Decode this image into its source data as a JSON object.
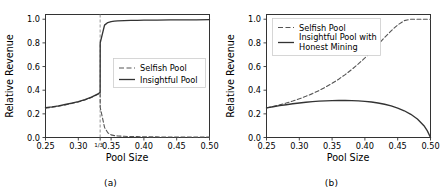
{
  "figure": {
    "panels": [
      {
        "caption": "(a)",
        "axis": {
          "xlabel": "Pool Size",
          "ylabel": "Relative Revenue",
          "xticks": [
            "0.25",
            "0.30",
            "0.35",
            "0.40",
            "0.45",
            "0.50"
          ],
          "xtick_values": [
            0.25,
            0.3,
            0.35,
            0.4,
            0.45,
            0.5
          ],
          "xtick_extra": {
            "label": "1/3",
            "value": 0.3333
          },
          "yticks": [
            "0.0",
            "0.2",
            "0.4",
            "0.6",
            "0.8",
            "1.0"
          ],
          "ytick_values": [
            0.0,
            0.2,
            0.4,
            0.6,
            0.8,
            1.0
          ],
          "xlim": [
            0.25,
            0.5
          ],
          "ylim": [
            0.0,
            1.04
          ]
        },
        "legend": {
          "position": "center-right",
          "entries": [
            {
              "label": "Selfish Pool",
              "style": "dashed",
              "color": "#555555"
            },
            {
              "label": "Insightful Pool",
              "style": "solid",
              "color": "#333333"
            }
          ]
        },
        "vline": {
          "value": 0.3333,
          "style": "dashed",
          "color": "#888888"
        }
      },
      {
        "caption": "(b)",
        "axis": {
          "xlabel": "Pool Size",
          "ylabel": "Relative Revenue",
          "xticks": [
            "0.25",
            "0.30",
            "0.35",
            "0.40",
            "0.45",
            "0.50"
          ],
          "xtick_values": [
            0.25,
            0.3,
            0.35,
            0.4,
            0.45,
            0.5
          ],
          "yticks": [
            "0.0",
            "0.2",
            "0.4",
            "0.6",
            "0.8",
            "1.0"
          ],
          "ytick_values": [
            0.0,
            0.2,
            0.4,
            0.6,
            0.8,
            1.0
          ],
          "xlim": [
            0.25,
            0.5
          ],
          "ylim": [
            0.0,
            1.04
          ]
        },
        "legend": {
          "position": "upper-left",
          "entries": [
            {
              "label": "Selfish Pool",
              "style": "dashed",
              "color": "#555555"
            },
            {
              "label": "Insightful Pool with",
              "label2": "Honest Mining",
              "style": "solid",
              "color": "#333333"
            }
          ]
        }
      }
    ]
  },
  "chart_data": [
    {
      "type": "line",
      "panel": "(a)",
      "title": "",
      "xlabel": "Pool Size",
      "ylabel": "Relative Revenue",
      "xlim": [
        0.25,
        0.5
      ],
      "ylim": [
        0.0,
        1.04
      ],
      "xticks": [
        0.25,
        0.3,
        0.35,
        0.4,
        0.45,
        0.5
      ],
      "yticks": [
        0.0,
        0.2,
        0.4,
        0.6,
        0.8,
        1.0
      ],
      "grid": false,
      "legend_position": "center right",
      "annotations": [
        {
          "type": "vline",
          "x": 0.3333,
          "label": "1/3",
          "style": "dashed"
        }
      ],
      "x": [
        0.25,
        0.26,
        0.27,
        0.28,
        0.29,
        0.3,
        0.31,
        0.32,
        0.33,
        0.3333,
        0.3334,
        0.34,
        0.345,
        0.35,
        0.355,
        0.36,
        0.37,
        0.38,
        0.39,
        0.4,
        0.42,
        0.44,
        0.46,
        0.48,
        0.5
      ],
      "series": [
        {
          "name": "Selfish Pool",
          "style": "dashed",
          "values": [
            0.248,
            0.256,
            0.265,
            0.276,
            0.288,
            0.3,
            0.317,
            0.338,
            0.366,
            0.38,
            0.255,
            0.085,
            0.04,
            0.022,
            0.016,
            0.013,
            0.01,
            0.008,
            0.007,
            0.006,
            0.005,
            0.004,
            0.004,
            0.003,
            0.003
          ]
        },
        {
          "name": "Insightful Pool",
          "style": "solid",
          "values": [
            0.252,
            0.259,
            0.268,
            0.279,
            0.291,
            0.304,
            0.321,
            0.341,
            0.368,
            0.382,
            0.8,
            0.95,
            0.972,
            0.98,
            0.984,
            0.986,
            0.988,
            0.99,
            0.991,
            0.992,
            0.993,
            0.994,
            0.995,
            0.995,
            0.996
          ]
        }
      ]
    },
    {
      "type": "line",
      "panel": "(b)",
      "title": "",
      "xlabel": "Pool Size",
      "ylabel": "Relative Revenue",
      "xlim": [
        0.25,
        0.5
      ],
      "ylim": [
        0.0,
        1.04
      ],
      "xticks": [
        0.25,
        0.3,
        0.35,
        0.4,
        0.45,
        0.5
      ],
      "yticks": [
        0.0,
        0.2,
        0.4,
        0.6,
        0.8,
        1.0
      ],
      "grid": false,
      "legend_position": "upper left",
      "x": [
        0.25,
        0.26,
        0.27,
        0.28,
        0.29,
        0.3,
        0.31,
        0.32,
        0.33,
        0.34,
        0.35,
        0.36,
        0.37,
        0.38,
        0.39,
        0.4,
        0.41,
        0.42,
        0.43,
        0.44,
        0.45,
        0.46,
        0.47,
        0.48,
        0.49,
        0.495,
        0.5
      ],
      "series": [
        {
          "name": "Selfish Pool",
          "style": "dashed",
          "values": [
            0.25,
            0.262,
            0.276,
            0.291,
            0.308,
            0.327,
            0.348,
            0.371,
            0.397,
            0.426,
            0.458,
            0.493,
            0.532,
            0.575,
            0.622,
            0.673,
            0.728,
            0.786,
            0.845,
            0.902,
            0.952,
            0.988,
            1.0,
            1.0,
            1.0,
            1.0,
            1.0
          ]
        },
        {
          "name": "Insightful Pool with Honest Mining",
          "style": "solid",
          "values": [
            0.25,
            0.26,
            0.269,
            0.277,
            0.285,
            0.292,
            0.298,
            0.303,
            0.307,
            0.31,
            0.312,
            0.313,
            0.313,
            0.312,
            0.31,
            0.306,
            0.3,
            0.292,
            0.281,
            0.267,
            0.249,
            0.226,
            0.196,
            0.157,
            0.1,
            0.058,
            0.0
          ]
        }
      ]
    }
  ]
}
